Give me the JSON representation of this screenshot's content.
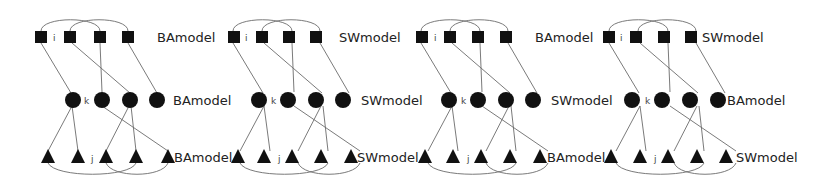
{
  "figure": {
    "node_color": "#111111",
    "edge_color": "#6b6b6b"
  },
  "panels": [
    {
      "id": 1,
      "layers": [
        {
          "shape": "square",
          "label": "BAmodel",
          "index_label": "i"
        },
        {
          "shape": "circle",
          "label": "BAmodel",
          "index_label": "k"
        },
        {
          "shape": "triangle",
          "label": "BAmodel",
          "index_label": "j"
        }
      ]
    },
    {
      "id": 2,
      "layers": [
        {
          "shape": "square",
          "label": "SWmodel",
          "index_label": "i"
        },
        {
          "shape": "circle",
          "label": "SWmodel",
          "index_label": "k"
        },
        {
          "shape": "triangle",
          "label": "SWmodel",
          "index_label": "j"
        }
      ]
    },
    {
      "id": 3,
      "layers": [
        {
          "shape": "square",
          "label": "BAmodel",
          "index_label": "i"
        },
        {
          "shape": "circle",
          "label": "SWmodel",
          "index_label": "k"
        },
        {
          "shape": "triangle",
          "label": "BAmodel",
          "index_label": "j"
        }
      ]
    },
    {
      "id": 4,
      "layers": [
        {
          "shape": "square",
          "label": "SWmodel",
          "index_label": "i"
        },
        {
          "shape": "circle",
          "label": "BAmodel",
          "index_label": "k"
        },
        {
          "shape": "triangle",
          "label": "SWmodel",
          "index_label": "j"
        }
      ]
    }
  ]
}
